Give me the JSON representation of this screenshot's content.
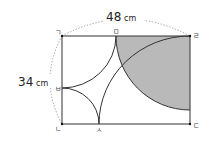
{
  "diagram": {
    "dimensions": {
      "width_label": "48",
      "height_label": "34",
      "unit": "cm"
    },
    "points": {
      "giyeok": "ㄱ",
      "nieun": "ㄴ",
      "digeut": "ㄷ",
      "rieul": "ㄹ",
      "mieum": "ㅁ",
      "bieup": "ㅂ",
      "siot": "ㅅ"
    },
    "colors": {
      "shade": "#b9b9b9",
      "line": "#333333",
      "dotted": "#888888"
    }
  }
}
